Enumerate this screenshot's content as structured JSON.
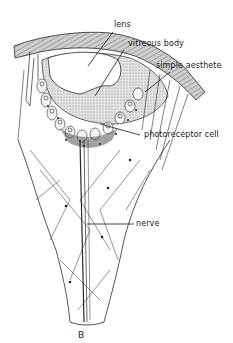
{
  "figure": {
    "panel_label": "B",
    "labels": [
      {
        "id": "lens",
        "text": "lens"
      },
      {
        "id": "vitreous_body",
        "text": "vitreous body"
      },
      {
        "id": "simple_aesthete",
        "text": "simple aesthete"
      },
      {
        "id": "photoreceptor_cell",
        "text": "photoreceptor cell"
      },
      {
        "id": "nerve",
        "text": "nerve"
      }
    ]
  },
  "colors": {
    "line": "#2a2a2a",
    "shell": "#bdbdbd",
    "vitreous": "#d6d6d6",
    "lens": "#ffffff",
    "pigment": "#555555"
  }
}
